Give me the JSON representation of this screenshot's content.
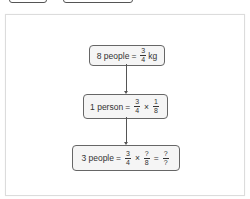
{
  "tabs": [
    {
      "label": ""
    },
    {
      "label": ""
    }
  ],
  "diagram": {
    "type": "flowchart",
    "direction": "top-to-bottom",
    "colors": {
      "box_border": "#666666",
      "box_fill": "#f5f5f5",
      "arrow": "#555555",
      "card_border": "#dcdcdc"
    },
    "nodes": [
      {
        "id": "n1",
        "lhs": "8 people",
        "eq": "=",
        "frac1": {
          "num": "3",
          "den": "4"
        },
        "unit": "kg"
      },
      {
        "id": "n2",
        "lhs": "1 person",
        "eq": "=",
        "frac1": {
          "num": "3",
          "den": "4"
        },
        "op1": "×",
        "frac2": {
          "num": "1",
          "den": "8"
        }
      },
      {
        "id": "n3",
        "lhs": "3 people",
        "eq": "=",
        "frac1": {
          "num": "3",
          "den": "4"
        },
        "op1": "×",
        "frac2": {
          "num": "?",
          "den": "8"
        },
        "eq2": "=",
        "frac3": {
          "num": "?",
          "den": "?"
        }
      }
    ],
    "edges": [
      {
        "from": "n1",
        "to": "n2"
      },
      {
        "from": "n2",
        "to": "n3"
      }
    ]
  }
}
